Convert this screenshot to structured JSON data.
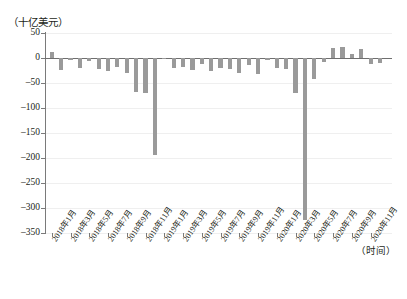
{
  "axis_labels": {
    "y_unit": "（十亿美元）",
    "x_unit": "（时间）"
  },
  "chart_data": {
    "type": "bar",
    "title": "",
    "subtitle": "",
    "xlabel": "（时间）",
    "ylabel": "（十亿美元）",
    "ylim": [
      -350,
      50
    ],
    "y_ticks": [
      50,
      0,
      -50,
      -100,
      -150,
      -200,
      -250,
      -300,
      -350
    ],
    "y_tick_labels": [
      "50",
      "0",
      "-50",
      "-100",
      "-150",
      "-200",
      "-250",
      "-300",
      "-350"
    ],
    "grid": true,
    "legend": null,
    "bar_color": "#9a9a9a",
    "x_tick_labels": [
      "2018年1月",
      "2018年3月",
      "2018年5月",
      "2018年7月",
      "2018年9月",
      "2018年11月",
      "2019年1月",
      "2019年3月",
      "2019年5月",
      "2019年7月",
      "2019年9月",
      "2019年11月",
      "2020年1月",
      "2020年3月",
      "2020年5月",
      "2020年7月",
      "2020年9月",
      "2020年11月"
    ],
    "categories": [
      "2018年1月",
      "2018年2月",
      "2018年3月",
      "2018年4月",
      "2018年5月",
      "2018年6月",
      "2018年7月",
      "2018年8月",
      "2018年9月",
      "2018年10月",
      "2018年11月",
      "2018年12月",
      "2019年1月",
      "2019年2月",
      "2019年3月",
      "2019年4月",
      "2019年5月",
      "2019年6月",
      "2019年7月",
      "2019年8月",
      "2019年9月",
      "2019年10月",
      "2019年11月",
      "2019年12月",
      "2020年1月",
      "2020年2月",
      "2020年3月",
      "2020年4月",
      "2020年5月",
      "2020年6月",
      "2020年7月",
      "2020年8月",
      "2020年9月",
      "2020年10月",
      "2020年11月",
      "2020年12月"
    ],
    "values": [
      12,
      -24,
      -3,
      -20,
      -6,
      -22,
      -26,
      -18,
      -30,
      -67,
      -70,
      -194,
      -2,
      -20,
      -18,
      -24,
      -12,
      -26,
      -20,
      -22,
      -30,
      -14,
      -32,
      -4,
      -20,
      -22,
      -70,
      -324,
      -42,
      -8,
      20,
      22,
      8,
      18,
      -12,
      -10
    ]
  }
}
